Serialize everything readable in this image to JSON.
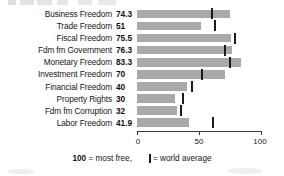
{
  "chart_data": {
    "type": "bar",
    "orientation": "horizontal",
    "title": "",
    "xlabel": "",
    "ylabel": "",
    "xlim": [
      0,
      100
    ],
    "grid": false,
    "axis_ticks": [
      0,
      50,
      100
    ],
    "axis_tick_labels": [
      "0",
      "50",
      "100"
    ],
    "categories": [
      "Business Freedom",
      "Trade Freedom",
      "Fiscal Freedom",
      "Fdm fm Government",
      "Monetary Freedom",
      "Investment Freedom",
      "Financial Freedom",
      "Property Rights",
      "Fdm fm Corruption",
      "Labor Freedom"
    ],
    "values": [
      74.3,
      51,
      75.5,
      76.3,
      83.3,
      70,
      40,
      30,
      32,
      41.9
    ],
    "value_labels": [
      "74.3",
      "51",
      "75.5",
      "76.3",
      "83.3",
      "70",
      "40",
      "30",
      "32",
      "41.9"
    ],
    "series": [
      {
        "name": "Country score",
        "values": [
          74.3,
          51,
          75.5,
          76.3,
          83.3,
          70,
          40,
          30,
          32,
          41.9
        ]
      },
      {
        "name": "World average",
        "marker": "vertical-tick",
        "values": [
          60,
          62,
          78,
          70,
          74,
          52,
          44,
          37,
          35,
          61
        ]
      }
    ],
    "legend": {
      "position": "bottom",
      "entries": [
        {
          "label": "100 = most free,",
          "emphasis": "100"
        },
        {
          "label": "= world average",
          "marker": "vertical-tick"
        }
      ]
    },
    "colors": {
      "bar": "#a9a9a9",
      "tick": "#1c1c1c",
      "axis": "#3a3a3a",
      "text": "#171717",
      "background": "#ffffff"
    }
  },
  "legend": {
    "most_free_number": "100",
    "most_free_text": " = most free,",
    "world_average_text": "= world average"
  }
}
